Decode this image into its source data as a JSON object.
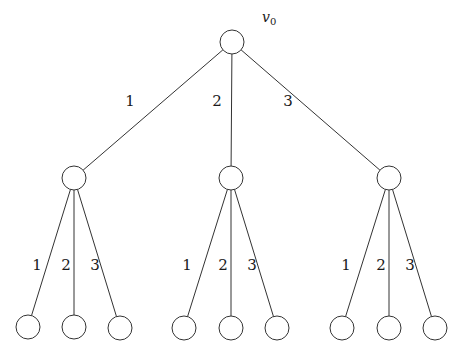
{
  "diagram": {
    "type": "tree",
    "root": {
      "id": "v0",
      "label": "v",
      "subscript": "0",
      "x": 232,
      "y": 42
    },
    "node_radius": 12,
    "stroke_color": "#333333",
    "nodes": [
      {
        "id": "a",
        "x": 74,
        "y": 178
      },
      {
        "id": "b",
        "x": 231,
        "y": 178
      },
      {
        "id": "c",
        "x": 389,
        "y": 178
      },
      {
        "id": "a1",
        "x": 28,
        "y": 327
      },
      {
        "id": "a2",
        "x": 74,
        "y": 327
      },
      {
        "id": "a3",
        "x": 120,
        "y": 328
      },
      {
        "id": "b1",
        "x": 184,
        "y": 328
      },
      {
        "id": "b2",
        "x": 231,
        "y": 328
      },
      {
        "id": "b3",
        "x": 277,
        "y": 328
      },
      {
        "id": "c1",
        "x": 342,
        "y": 328
      },
      {
        "id": "c2",
        "x": 389,
        "y": 328
      },
      {
        "id": "c3",
        "x": 435,
        "y": 328
      }
    ],
    "edges": [
      {
        "from": "v0",
        "to": "a",
        "label": "1",
        "lx": 130,
        "ly": 106
      },
      {
        "from": "v0",
        "to": "b",
        "label": "2",
        "lx": 217,
        "ly": 106
      },
      {
        "from": "v0",
        "to": "c",
        "label": "3",
        "lx": 288,
        "ly": 106
      },
      {
        "from": "a",
        "to": "a1",
        "label": "1",
        "lx": 37,
        "ly": 270
      },
      {
        "from": "a",
        "to": "a2",
        "label": "2",
        "lx": 66,
        "ly": 270
      },
      {
        "from": "a",
        "to": "a3",
        "label": "3",
        "lx": 95,
        "ly": 270
      },
      {
        "from": "b",
        "to": "b1",
        "label": "1",
        "lx": 187,
        "ly": 270
      },
      {
        "from": "b",
        "to": "b2",
        "label": "2",
        "lx": 223,
        "ly": 270
      },
      {
        "from": "b",
        "to": "b3",
        "label": "3",
        "lx": 252,
        "ly": 270
      },
      {
        "from": "c",
        "to": "c1",
        "label": "1",
        "lx": 346,
        "ly": 270
      },
      {
        "from": "c",
        "to": "c2",
        "label": "2",
        "lx": 381,
        "ly": 270
      },
      {
        "from": "c",
        "to": "c3",
        "label": "3",
        "lx": 410,
        "ly": 270
      }
    ]
  }
}
